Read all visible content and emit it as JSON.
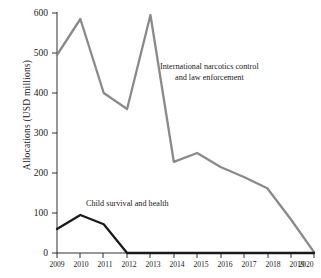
{
  "chart_data": {
    "type": "line",
    "title": "",
    "xlabel": "",
    "ylabel": "Allocations (USD millions)",
    "x": [
      2009,
      2010,
      2011,
      2012,
      2013,
      2014,
      2015,
      2016,
      2017,
      2018,
      2019,
      2020
    ],
    "xticklabels": [
      "2009",
      "2010",
      "2011",
      "2012",
      "2013",
      "2014",
      "2015",
      "2016",
      "2017",
      "2018",
      "2019",
      "2020"
    ],
    "yticklabels": [
      "0",
      "100",
      "200",
      "300",
      "400",
      "500",
      "600"
    ],
    "yticks": [
      0,
      100,
      200,
      300,
      400,
      500,
      600
    ],
    "ylim": [
      0,
      600
    ],
    "xlim": [
      2009,
      2020
    ],
    "grid": false,
    "legend_position": "inline-annotations",
    "series": [
      {
        "name": "International narcotics control and law enforcement",
        "color": "#8a8a8a",
        "values": [
          495,
          585,
          400,
          360,
          595,
          228,
          250,
          215,
          190,
          162,
          85,
          2
        ]
      },
      {
        "name": "Child survival and health",
        "color": "#1a1a1a",
        "values": [
          60,
          95,
          72,
          0,
          0,
          0,
          0,
          0,
          0,
          0,
          0,
          0
        ]
      }
    ],
    "annotations": [
      {
        "id": "narcotics",
        "line1": "International narcotics control",
        "line2": "and law enforcement"
      },
      {
        "id": "child",
        "line1": "Child survival and health"
      }
    ]
  },
  "axis": {
    "y_label": "Allocations (USD millions)",
    "y_ticks": [
      "600",
      "500",
      "400",
      "300",
      "200",
      "100",
      "0"
    ],
    "x_ticks": [
      "2009",
      "2010",
      "2011",
      "2012",
      "2013",
      "2014",
      "2015",
      "2016",
      "2017",
      "2018",
      "2019",
      "2020"
    ]
  },
  "annotations": {
    "narcotics_line1": "International narcotics control",
    "narcotics_line2": "and law enforcement",
    "child_line1": "Child survival and health"
  },
  "colors": {
    "narcotics_line": "#8a8a8a",
    "child_line": "#1a1a1a",
    "axis": "#1a1a1a",
    "background": "#ffffff"
  }
}
